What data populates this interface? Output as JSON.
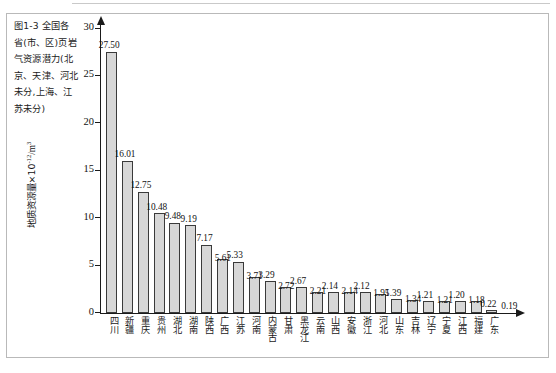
{
  "figure": {
    "caption": "图1-3  全国各省(市、区)页岩气资源潜力(北京、天津、河北未分,上海、江苏未分)",
    "caption_lines": [
      "图1-3  全国各",
      "省(市、区)页岩",
      "气资源潜力(北",
      "京、天津、河北",
      "未分,上海、江",
      "苏未分)"
    ]
  },
  "chart_data": {
    "type": "bar",
    "xlabel": "",
    "ylabel": "地质资源量×10⁻¹²/m³",
    "ylabel_parts": {
      "text": "地质资源量×10",
      "exponent": "-12",
      "unit": "/m",
      "unit_exponent": "3"
    },
    "ylim": [
      0,
      30
    ],
    "yticks": [
      0,
      5,
      10,
      15,
      20,
      25,
      30
    ],
    "ytick_labels": [
      "0",
      "5",
      "10",
      "15",
      "20",
      "25",
      "30"
    ],
    "grid": false,
    "legend": null,
    "bar_color": "#d7d7d7",
    "bar_edge_color": "#3a3a3a",
    "categories": [
      "四川",
      "新疆",
      "重庆",
      "贵州",
      "湖北",
      "湖南",
      "陕西",
      "广西",
      "江苏",
      "河南",
      "内蒙古",
      "甘肃",
      "黑龙江",
      "云南",
      "山西",
      "安徽",
      "浙江",
      "河北",
      "山东",
      "吉林",
      "辽宁",
      "宁夏",
      "江西",
      "福建",
      "广东"
    ],
    "values": [
      27.5,
      16.01,
      12.75,
      10.48,
      9.48,
      9.19,
      7.17,
      5.61,
      5.33,
      3.71,
      3.29,
      2.72,
      2.67,
      2.21,
      2.14,
      2.14,
      2.12,
      1.95,
      1.39,
      1.34,
      1.21,
      1.21,
      1.2,
      1.18,
      0.22
    ],
    "value_labels": [
      "27.50",
      "16.01",
      "12.75",
      "10.48",
      "9.48",
      "9.19",
      "7.17",
      "5.61",
      "5.33",
      "3.71",
      "3.29",
      "2.72",
      "2.67",
      "2.21",
      "2.14",
      "2.14",
      "2.12",
      "1.95",
      "1.39",
      "1.34",
      "1.21",
      "1.21",
      "1.20",
      "1.18",
      "0.22"
    ],
    "extra_value_label": "0.19"
  }
}
